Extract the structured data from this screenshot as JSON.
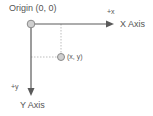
{
  "diagram": {
    "origin_label": "Origin (0, 0)",
    "x_axis_label": "X Axis",
    "y_axis_label": "Y Axis",
    "x_direction_label": "+x",
    "y_direction_label": "+y",
    "point_label": "(x, y)",
    "colors": {
      "line": "#5a5a5a",
      "dotted": "#bdbdbd",
      "node_fill": "#cfcfcf",
      "node_stroke": "#8a8a8a",
      "text": "#555555"
    }
  }
}
